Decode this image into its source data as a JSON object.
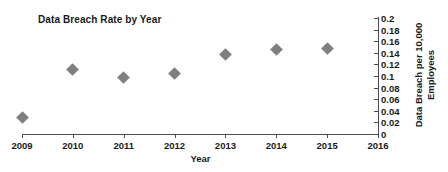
{
  "chart_data": {
    "type": "scatter",
    "title": "Data Breach Rate by Year",
    "xlabel": "Year",
    "ylabel_line1": "Data Breach per 10,000",
    "ylabel_line2": "Employees",
    "ylabel": "Data Breach per 10,000 Employees",
    "x": [
      2009,
      2010,
      2011,
      2012,
      2013,
      2014,
      2015
    ],
    "values": [
      0.028,
      0.111,
      0.098,
      0.105,
      0.137,
      0.145,
      0.147
    ],
    "points": [
      {
        "x": 2009,
        "y": 0.028
      },
      {
        "x": 2010,
        "y": 0.111
      },
      {
        "x": 2011,
        "y": 0.098
      },
      {
        "x": 2012,
        "y": 0.105
      },
      {
        "x": 2013,
        "y": 0.137
      },
      {
        "x": 2014,
        "y": 0.145
      },
      {
        "x": 2015,
        "y": 0.147
      }
    ],
    "xlim": [
      2009,
      2016
    ],
    "ylim": [
      0,
      0.2
    ],
    "xticks": [
      "2009",
      "2010",
      "2011",
      "2012",
      "2013",
      "2014",
      "2015",
      "2016"
    ],
    "xtick_values": [
      2009,
      2010,
      2011,
      2012,
      2013,
      2014,
      2015,
      2016
    ],
    "yticks": [
      "0",
      "0.02",
      "0.04",
      "0.06",
      "0.08",
      "0.1",
      "0.12",
      "0.14",
      "0.16",
      "0.18",
      "0.2"
    ],
    "ytick_values": [
      0,
      0.02,
      0.04,
      0.06,
      0.08,
      0.1,
      0.12,
      0.14,
      0.16,
      0.18,
      0.2
    ],
    "grid": false,
    "legend": false,
    "y_axis_position": "right",
    "marker_shape": "diamond",
    "marker_color": "#7f7f7f",
    "axis_color": "#4d4d4d",
    "background": "#ffffff"
  }
}
